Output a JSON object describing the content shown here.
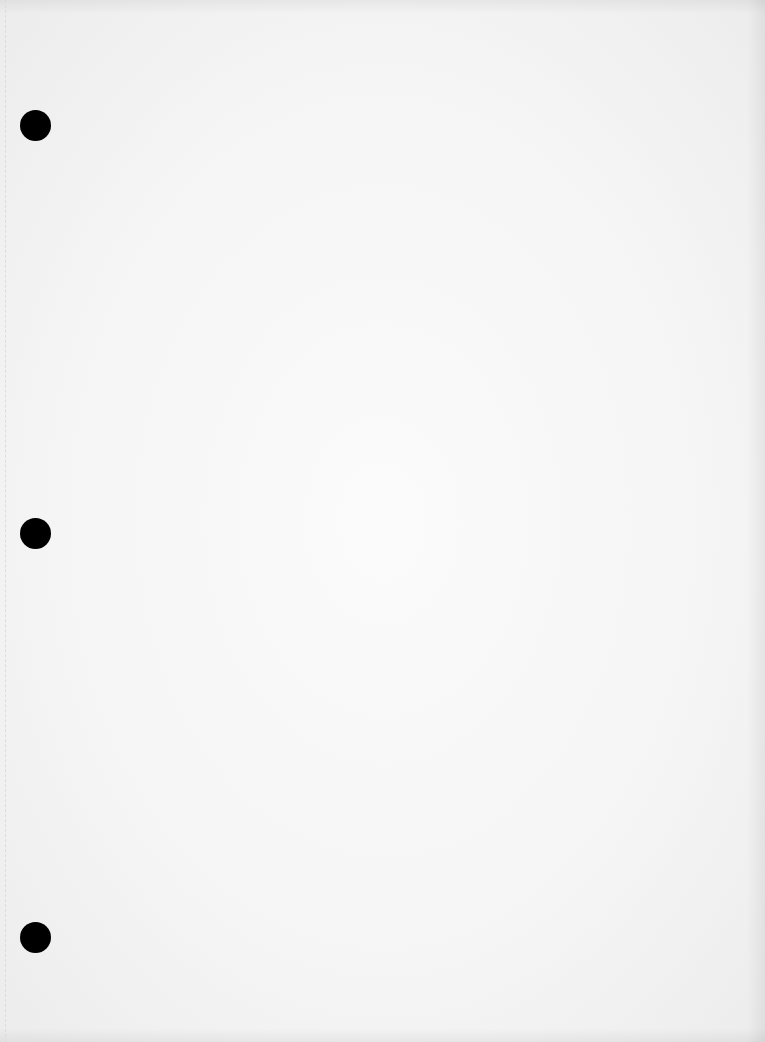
{
  "document": {
    "type": "blank scanned page",
    "content": "",
    "paper_color": "#f4f4f4",
    "hole_color": "#000000",
    "punch_holes": [
      {
        "cx": 35,
        "cy": 125
      },
      {
        "cx": 35,
        "cy": 533
      },
      {
        "cx": 35,
        "cy": 937
      }
    ]
  }
}
